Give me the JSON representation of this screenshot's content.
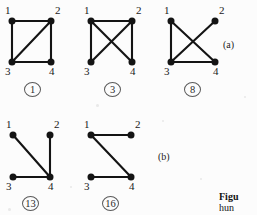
{
  "figure": {
    "background_color": "#fcfcfc",
    "ink_color": "#141414",
    "panel_labels": [
      {
        "id": "a",
        "text": "(a)",
        "x": 223,
        "y": 40
      },
      {
        "id": "b",
        "text": "(b)",
        "x": 158,
        "y": 152
      }
    ],
    "caption": {
      "line1": "Figu",
      "line2": "hun"
    },
    "graphs": [
      {
        "id": "graph-1",
        "label": "1",
        "x": 0,
        "y": 0,
        "width": 80,
        "height": 100,
        "vertices": [
          {
            "name": "1",
            "x": 12,
            "y": 21,
            "label_x": 5,
            "label_y": 5
          },
          {
            "name": "2",
            "x": 51,
            "y": 21,
            "label_x": 55,
            "label_y": 5
          },
          {
            "name": "3",
            "x": 12,
            "y": 62,
            "label_x": 5,
            "label_y": 66
          },
          {
            "name": "4",
            "x": 51,
            "y": 62,
            "label_x": 49,
            "label_y": 66
          }
        ],
        "edges": [
          {
            "from": "1",
            "to": "2"
          },
          {
            "from": "1",
            "to": "3"
          },
          {
            "from": "2",
            "to": "3"
          },
          {
            "from": "2",
            "to": "4"
          },
          {
            "from": "3",
            "to": "4"
          }
        ],
        "id_x": 24,
        "id_y": 82
      },
      {
        "id": "graph-3",
        "label": "3",
        "x": 80,
        "y": 0,
        "width": 80,
        "height": 100,
        "vertices": [
          {
            "name": "1",
            "x": 11,
            "y": 21,
            "label_x": 4,
            "label_y": 5
          },
          {
            "name": "2",
            "x": 52,
            "y": 21,
            "label_x": 56,
            "label_y": 5
          },
          {
            "name": "3",
            "x": 11,
            "y": 62,
            "label_x": 4,
            "label_y": 66
          },
          {
            "name": "4",
            "x": 52,
            "y": 62,
            "label_x": 50,
            "label_y": 66
          }
        ],
        "edges": [
          {
            "from": "1",
            "to": "2"
          },
          {
            "from": "1",
            "to": "3"
          },
          {
            "from": "1",
            "to": "4"
          },
          {
            "from": "2",
            "to": "3"
          },
          {
            "from": "2",
            "to": "4"
          }
        ],
        "id_x": 24,
        "id_y": 82
      },
      {
        "id": "graph-8",
        "label": "8",
        "x": 160,
        "y": 0,
        "width": 80,
        "height": 100,
        "vertices": [
          {
            "name": "1",
            "x": 11,
            "y": 21,
            "label_x": 4,
            "label_y": 5
          },
          {
            "name": "2",
            "x": 55,
            "y": 21,
            "label_x": 59,
            "label_y": 5
          },
          {
            "name": "3",
            "x": 11,
            "y": 62,
            "label_x": 4,
            "label_y": 66
          },
          {
            "name": "4",
            "x": 55,
            "y": 62,
            "label_x": 53,
            "label_y": 66
          }
        ],
        "edges": [
          {
            "from": "1",
            "to": "3"
          },
          {
            "from": "1",
            "to": "4"
          },
          {
            "from": "2",
            "to": "3"
          },
          {
            "from": "3",
            "to": "4"
          }
        ],
        "id_x": 24,
        "id_y": 82
      },
      {
        "id": "graph-13",
        "label": "13",
        "x": 0,
        "y": 113,
        "width": 80,
        "height": 102,
        "vertices": [
          {
            "name": "1",
            "x": 13,
            "y": 22,
            "label_x": 6,
            "label_y": 6
          },
          {
            "name": "2",
            "x": 50,
            "y": 22,
            "label_x": 54,
            "label_y": 6
          },
          {
            "name": "3",
            "x": 13,
            "y": 64,
            "label_x": 6,
            "label_y": 68
          },
          {
            "name": "4",
            "x": 50,
            "y": 64,
            "label_x": 48,
            "label_y": 68
          }
        ],
        "edges": [
          {
            "from": "1",
            "to": "4"
          },
          {
            "from": "2",
            "to": "4"
          },
          {
            "from": "3",
            "to": "4"
          }
        ],
        "id_x": 22,
        "id_y": 83
      },
      {
        "id": "graph-16",
        "label": "16",
        "x": 80,
        "y": 113,
        "width": 80,
        "height": 102,
        "vertices": [
          {
            "name": "1",
            "x": 11,
            "y": 22,
            "label_x": 4,
            "label_y": 6
          },
          {
            "name": "2",
            "x": 51,
            "y": 22,
            "label_x": 55,
            "label_y": 6
          },
          {
            "name": "3",
            "x": 11,
            "y": 64,
            "label_x": 4,
            "label_y": 68
          },
          {
            "name": "4",
            "x": 51,
            "y": 64,
            "label_x": 49,
            "label_y": 68
          }
        ],
        "edges": [
          {
            "from": "1",
            "to": "2"
          },
          {
            "from": "1",
            "to": "4"
          },
          {
            "from": "3",
            "to": "4"
          }
        ],
        "id_x": 22,
        "id_y": 83
      }
    ]
  }
}
